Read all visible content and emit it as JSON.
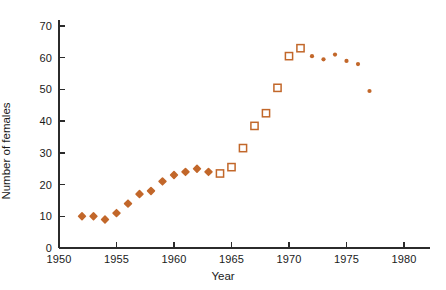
{
  "chart_data": {
    "type": "scatter",
    "title": "",
    "xlabel": "Year",
    "ylabel": "Number of females",
    "xlim": [
      1950,
      1981
    ],
    "ylim": [
      0,
      72
    ],
    "xticks": [
      1950,
      1955,
      1960,
      1965,
      1970,
      1975,
      1980
    ],
    "yticks": [
      0,
      10,
      20,
      30,
      40,
      50,
      60,
      70
    ],
    "grid": false,
    "legend": "none",
    "marker_color": "#c2672a",
    "axis_color": "#2b2b2b",
    "series": [
      {
        "name": "filled-diamond-early",
        "marker": "diamond-filled",
        "points": [
          {
            "x": 1952,
            "y": 10
          },
          {
            "x": 1953,
            "y": 10
          },
          {
            "x": 1954,
            "y": 9
          },
          {
            "x": 1955,
            "y": 11
          },
          {
            "x": 1956,
            "y": 14
          },
          {
            "x": 1957,
            "y": 17
          },
          {
            "x": 1958,
            "y": 18
          },
          {
            "x": 1959,
            "y": 21
          },
          {
            "x": 1960,
            "y": 23
          },
          {
            "x": 1961,
            "y": 24
          },
          {
            "x": 1962,
            "y": 25
          },
          {
            "x": 1963,
            "y": 24
          }
        ]
      },
      {
        "name": "open-square-mid",
        "marker": "square-open",
        "points": [
          {
            "x": 1964,
            "y": 23.5
          },
          {
            "x": 1965,
            "y": 25.5
          },
          {
            "x": 1966,
            "y": 31.5
          },
          {
            "x": 1967,
            "y": 38.5
          },
          {
            "x": 1968,
            "y": 42.5
          },
          {
            "x": 1969,
            "y": 50.5
          },
          {
            "x": 1970,
            "y": 60.5
          },
          {
            "x": 1971,
            "y": 63
          }
        ]
      },
      {
        "name": "small-dot-late",
        "marker": "dot-filled",
        "points": [
          {
            "x": 1972,
            "y": 60.5
          },
          {
            "x": 1973,
            "y": 59.5
          },
          {
            "x": 1974,
            "y": 61
          },
          {
            "x": 1975,
            "y": 59
          },
          {
            "x": 1976,
            "y": 58
          },
          {
            "x": 1977,
            "y": 49.5
          }
        ]
      }
    ]
  }
}
